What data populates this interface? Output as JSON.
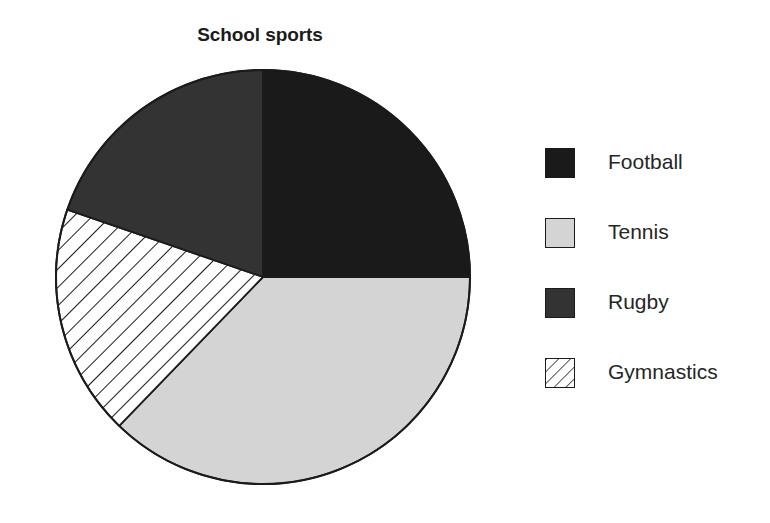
{
  "chart_data": {
    "type": "pie",
    "title": "School sports",
    "xlabel": "",
    "ylabel": "",
    "legend_position": "right",
    "grid": false,
    "categories": [
      "Football",
      "Tennis",
      "Rugby",
      "Gymnastics"
    ],
    "values": [
      25,
      37,
      20,
      18
    ],
    "units": "percent",
    "slices": [
      {
        "label": "Football",
        "value": 25,
        "start_angle_deg": 0,
        "end_angle_deg": 90,
        "sweep_deg": 90,
        "color": "#1a1a1a",
        "fill": "solid",
        "swatch_icon": "solid-dark-swatch"
      },
      {
        "label": "Tennis",
        "value": 37,
        "start_angle_deg": 90,
        "end_angle_deg": 224,
        "sweep_deg": 134,
        "color": "#d4d4d4",
        "fill": "solid",
        "swatch_icon": "solid-light-gray-swatch"
      },
      {
        "label": "Gymnastics",
        "value": 18,
        "start_angle_deg": 224,
        "end_angle_deg": 289,
        "sweep_deg": 65,
        "color": "#ffffff",
        "fill": "diagonal-hatch",
        "swatch_icon": "diagonal-hatch-swatch"
      },
      {
        "label": "Rugby",
        "value": 20,
        "start_angle_deg": 289,
        "end_angle_deg": 360,
        "sweep_deg": 71,
        "color": "#333333",
        "fill": "solid",
        "swatch_icon": "solid-gray-swatch"
      }
    ],
    "geometry": {
      "center_x": 208,
      "center_y": 208,
      "radius": 207,
      "start_at": "12 o'clock",
      "direction": "clockwise"
    },
    "colors": {
      "football": "#1a1a1a",
      "tennis": "#d4d4d4",
      "rugby": "#333333",
      "gymnastics": "#ffffff",
      "outline": "#1b1b1b",
      "background": "#ffffff",
      "text": "#262626"
    }
  },
  "legend": {
    "items": [
      {
        "label": "Football",
        "color": "#1a1a1a",
        "fill": "solid",
        "icon": "solid-dark-swatch"
      },
      {
        "label": "Tennis",
        "color": "#d4d4d4",
        "fill": "solid",
        "icon": "solid-light-gray-swatch"
      },
      {
        "label": "Rugby",
        "color": "#333333",
        "fill": "solid",
        "icon": "solid-gray-swatch"
      },
      {
        "label": "Gymnastics",
        "color": "#ffffff",
        "fill": "diagonal-hatch",
        "icon": "diagonal-hatch-swatch"
      }
    ]
  }
}
